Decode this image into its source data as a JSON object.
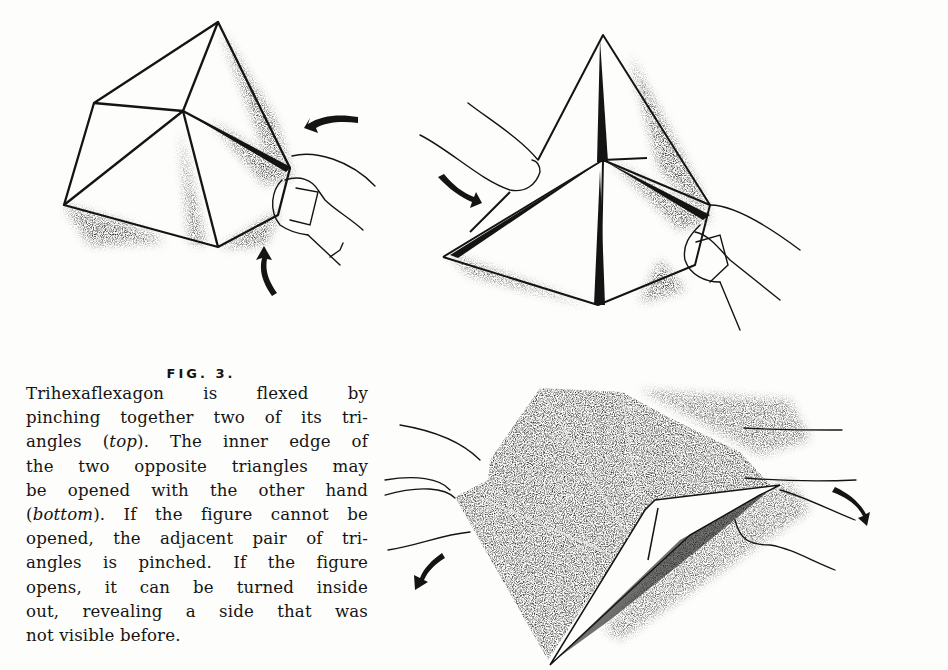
{
  "figure": {
    "label": "FIG. 3.",
    "panels": [
      {
        "id": "top-left",
        "subject": "trihexaflexagon pinched by thumb and finger",
        "arrows": [
          "curved-arrow-left",
          "curved-arrow-up"
        ]
      },
      {
        "id": "top-right",
        "subject": "trihexaflexagon pinched, pointing upward",
        "arrows": [
          "curved-arrow-down-right"
        ]
      },
      {
        "id": "bottom",
        "subject": "flexagon opened with both hands, dark shaded side",
        "arrows": [
          "curved-arrow-down-left",
          "curved-arrow-down-right"
        ]
      }
    ],
    "colors": {
      "ink": "#141414",
      "paper": "#fdfdfb",
      "shade": "#3a3a3a"
    }
  },
  "caption": {
    "lines": [
      {
        "parts": [
          {
            "t": "Trihexaflexagon is flexed by"
          }
        ]
      },
      {
        "parts": [
          {
            "t": "pinching together two of its tri-"
          }
        ]
      },
      {
        "parts": [
          {
            "t": "angles ("
          },
          {
            "t": "top",
            "i": true
          },
          {
            "t": "). The inner edge of"
          }
        ]
      },
      {
        "parts": [
          {
            "t": "the two opposite triangles may"
          }
        ]
      },
      {
        "parts": [
          {
            "t": "be opened with the other hand"
          }
        ]
      },
      {
        "parts": [
          {
            "t": "("
          },
          {
            "t": "bottom",
            "i": true
          },
          {
            "t": "). If the figure cannot be"
          }
        ]
      },
      {
        "parts": [
          {
            "t": "opened, the adjacent pair of tri-"
          }
        ]
      },
      {
        "parts": [
          {
            "t": "angles is pinched. If the figure"
          }
        ]
      },
      {
        "parts": [
          {
            "t": "opens, it can be turned inside"
          }
        ]
      },
      {
        "parts": [
          {
            "t": "out, revealing a side that was"
          }
        ]
      },
      {
        "parts": [
          {
            "t": "not visible before."
          }
        ]
      }
    ],
    "l0a": "Trihexaflexagon is flexed by",
    "l1a": "pinching together two of its tri-",
    "l2a": "angles (",
    "l2b": "top",
    "l2c": "). The inner edge of",
    "l3a": "the two opposite triangles may",
    "l4a": "be opened with the other hand",
    "l5a": "(",
    "l5b": "bottom",
    "l5c": "). If the figure cannot be",
    "l6a": "opened, the adjacent pair of tri-",
    "l7a": "angles is pinched. If the figure",
    "l8a": "opens, it can be turned inside",
    "l9a": "out, revealing a side that was",
    "l10a": "not visible before."
  }
}
